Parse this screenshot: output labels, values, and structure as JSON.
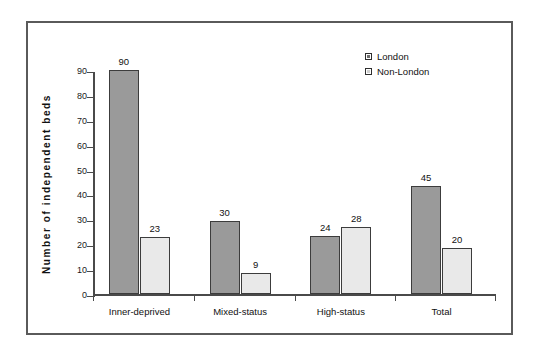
{
  "chart_data": {
    "type": "bar",
    "title": "",
    "xlabel": "",
    "ylabel": "Number  of  independent  beds",
    "ylim": [
      0,
      90
    ],
    "ytick_step": 10,
    "yticks": [
      "90",
      "80",
      "70",
      "60",
      "50",
      "40",
      "30",
      "20",
      "10",
      "0"
    ],
    "grid": false,
    "legend_position": "top-right",
    "categories": [
      "Inner-deprived",
      "Mixed-status",
      "High-status",
      "Total"
    ],
    "series": [
      {
        "name": "London",
        "color": "#9a9a9a",
        "values": [
          90,
          30,
          24,
          45
        ],
        "plotted": [
          90,
          29.5,
          23.5,
          43.5
        ],
        "labels": [
          "90",
          "30",
          "24",
          "45"
        ]
      },
      {
        "name": "Non-London",
        "color": "#e9e9e9",
        "values": [
          23,
          9,
          28,
          20
        ],
        "plotted": [
          22.8,
          8.4,
          27,
          18.5
        ],
        "labels": [
          "23",
          "9",
          "28",
          "20"
        ]
      }
    ]
  },
  "legend": {
    "items": [
      {
        "label": "London",
        "swatch": "london"
      },
      {
        "label": "Non-London",
        "swatch": "nonlondon"
      }
    ]
  }
}
